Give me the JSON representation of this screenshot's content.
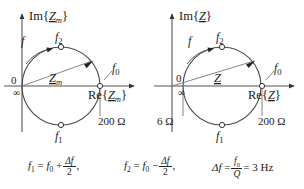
{
  "figure": {
    "type": "complex-impedance-locus"
  },
  "panels": [
    {
      "id": "left",
      "name": "motional-impedance",
      "axis": {
        "imag_label_pre": "Im{",
        "imag_label_var": "Z",
        "imag_label_sub": "m",
        "imag_label_post": "}",
        "real_label_pre": "Re{",
        "real_label_var": "Z",
        "real_label_sub": "m",
        "real_label_post": "}",
        "origin_label": "0",
        "infinity_label": "∞"
      },
      "phasor": {
        "var": "Z",
        "sub": "m"
      },
      "markers": {
        "f": "f",
        "f0": "f",
        "f0_sub": "0",
        "f1": "f",
        "f1_sub": "1",
        "f2": "f",
        "f2_sub": "2"
      },
      "annotations": [
        {
          "name": "right-intercept-resistance",
          "text": "200 Ω"
        }
      ],
      "geometry": {
        "circle_left_x": 22,
        "circle_right_x": 100,
        "circle_cx": 61,
        "circle_cy": 86,
        "circle_r": 39,
        "axis_y": 86,
        "axis_x": 22
      }
    },
    {
      "id": "right",
      "name": "total-impedance",
      "axis": {
        "imag_label_pre": "Im{",
        "imag_label_var": "Z",
        "imag_label_sub": "",
        "imag_label_post": "}",
        "real_label_pre": "Re{",
        "real_label_var": "Z",
        "real_label_sub": "",
        "real_label_post": "}",
        "origin_label": "0",
        "infinity_label": "∞"
      },
      "phasor": {
        "var": "Z",
        "sub": ""
      },
      "markers": {
        "f": "f",
        "f0": "f",
        "f0_sub": "0",
        "f1": "f",
        "f1_sub": "1",
        "f2": "f",
        "f2_sub": "2"
      },
      "annotations": [
        {
          "name": "left-intercept-resistance",
          "text": "6 Ω"
        },
        {
          "name": "right-intercept-resistance",
          "text": "200 Ω"
        }
      ],
      "geometry": {
        "circle_left_x": 183,
        "circle_right_x": 262,
        "circle_cx": 222,
        "circle_cy": 86,
        "circle_r": 39,
        "axis_y": 86,
        "axis_x": 172
      }
    }
  ],
  "equations": {
    "eq1": {
      "lhs_var": "f",
      "lhs_sub": "1",
      "eq": "=",
      "rhs_var": "f",
      "rhs_sub": "0",
      "op": "+",
      "frac_num": "Δf",
      "frac_den": "2",
      "trail": ","
    },
    "eq2": {
      "lhs_var": "f",
      "lhs_sub": "2",
      "eq": "=",
      "rhs_var": "f",
      "rhs_sub": "0",
      "op": "−",
      "frac_num": "Δf",
      "frac_den": "2",
      "trail": ","
    },
    "eq3": {
      "lhs": "Δf",
      "eq": "=",
      "frac_num_var": "f",
      "frac_num_sub": "0",
      "frac_den": "Q",
      "eq2": "=",
      "value": "3 Hz"
    }
  },
  "colors": {
    "stroke": "#3a3a3a",
    "circle": "#4a4a4a",
    "text": "#1a1a1a",
    "background": "#ffffff"
  }
}
